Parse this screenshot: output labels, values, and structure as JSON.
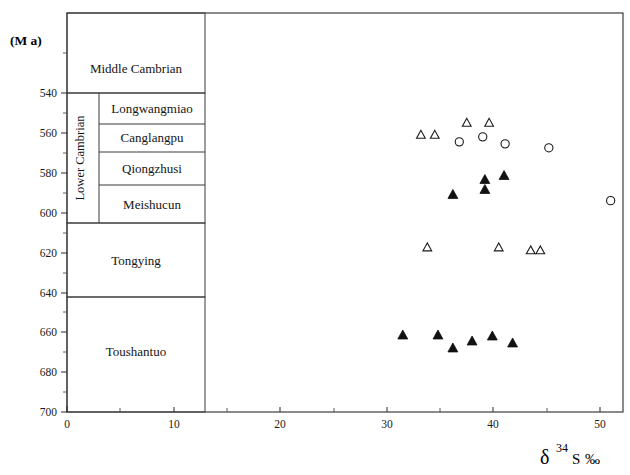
{
  "figure": {
    "unit_label": "(M  a)",
    "axis_title_delta": "δ",
    "axis_title_mass": "34",
    "axis_title_element": "S",
    "axis_title_permil": "‰"
  },
  "axes": {
    "x": {
      "label": "δ 34 S ‰",
      "min": 0,
      "max": 55.4,
      "ticks": [
        0,
        10,
        20,
        30,
        40,
        50
      ],
      "tick_labels": [
        "0",
        "10",
        "20",
        "30",
        "40",
        "50"
      ],
      "minor_step": 5
    },
    "y": {
      "label": "(M  a)",
      "min": 521,
      "max": 700,
      "ticks": [
        540,
        560,
        580,
        600,
        620,
        640,
        660,
        680,
        700
      ],
      "tick_labels": [
        "540",
        "560",
        "580",
        "600",
        "620",
        "640",
        "660",
        "680",
        "700"
      ],
      "minor_step": 10,
      "inverted": true
    }
  },
  "stratigraphy": {
    "series_label": "Lower Cambrian",
    "units": [
      {
        "name": "Middle Cambrian",
        "top_ma": 521,
        "base_ma": 540,
        "level": "outer"
      },
      {
        "name": "Longwangmiao",
        "top_ma": 540,
        "base_ma": 555,
        "level": "inner"
      },
      {
        "name": "Canglangpu",
        "top_ma": 555,
        "base_ma": 570,
        "level": "inner"
      },
      {
        "name": "Qiongzhusi",
        "top_ma": 570,
        "base_ma": 586,
        "level": "inner"
      },
      {
        "name": "Meishucun",
        "top_ma": 586,
        "base_ma": 605,
        "level": "inner"
      },
      {
        "name": "Tongying",
        "top_ma": 605,
        "base_ma": 645,
        "level": "outer"
      },
      {
        "name": "Toushantuo",
        "top_ma": 645,
        "base_ma": 700,
        "level": "outer"
      }
    ]
  },
  "chart_data": {
    "type": "scatter",
    "title": "",
    "xlabel": "δ 34 S ‰",
    "ylabel": "(M a)",
    "xlim": [
      0,
      55.4
    ],
    "ylim": [
      700,
      521
    ],
    "y_inverted": true,
    "grid": false,
    "legend": "none",
    "series": [
      {
        "name": "open-triangle",
        "marker": "triangle-open",
        "points": [
          {
            "x": 33.2,
            "y": 561.0
          },
          {
            "x": 34.5,
            "y": 561.0
          },
          {
            "x": 37.5,
            "y": 555.0
          },
          {
            "x": 39.6,
            "y": 555.0
          },
          {
            "x": 33.8,
            "y": 617.5
          },
          {
            "x": 40.5,
            "y": 617.5
          },
          {
            "x": 43.5,
            "y": 619.0
          },
          {
            "x": 44.4,
            "y": 619.0
          }
        ]
      },
      {
        "name": "open-circle",
        "marker": "circle-open",
        "points": [
          {
            "x": 36.8,
            "y": 564.5
          },
          {
            "x": 39.0,
            "y": 562.0
          },
          {
            "x": 41.1,
            "y": 565.5
          },
          {
            "x": 45.2,
            "y": 567.5
          },
          {
            "x": 51.0,
            "y": 594.0
          }
        ]
      },
      {
        "name": "filled-triangle",
        "marker": "triangle-filled",
        "points": [
          {
            "x": 36.2,
            "y": 591.0
          },
          {
            "x": 39.2,
            "y": 583.5
          },
          {
            "x": 39.2,
            "y": 588.5
          },
          {
            "x": 41.0,
            "y": 581.5
          },
          {
            "x": 31.5,
            "y": 661.5
          },
          {
            "x": 34.8,
            "y": 661.5
          },
          {
            "x": 36.2,
            "y": 668.0
          },
          {
            "x": 38.0,
            "y": 664.5
          },
          {
            "x": 39.9,
            "y": 662.0
          },
          {
            "x": 41.8,
            "y": 665.5
          }
        ]
      }
    ]
  }
}
